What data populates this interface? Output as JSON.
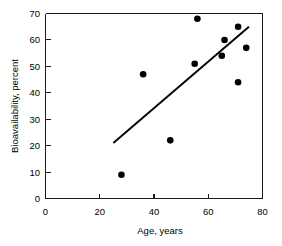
{
  "chart_data": {
    "type": "scatter",
    "title": "",
    "xlabel": "Age, years",
    "ylabel": "Bioavailability, percent",
    "xlim": [
      0,
      80
    ],
    "ylim": [
      0,
      70
    ],
    "xticks": [
      0,
      20,
      40,
      60,
      80
    ],
    "yticks": [
      0,
      10,
      20,
      30,
      40,
      50,
      60,
      70
    ],
    "xtick_labels": [
      "0",
      "20",
      "40",
      "60",
      "80"
    ],
    "ytick_labels": [
      "0",
      "10",
      "20",
      "30",
      "40",
      "50",
      "60",
      "70"
    ],
    "grid": false,
    "legend": null,
    "series": [
      {
        "name": "Bioavailability vs age",
        "marker": "filled-circle",
        "color": "#000000",
        "points": [
          {
            "x": 28,
            "y": 9
          },
          {
            "x": 36,
            "y": 47
          },
          {
            "x": 46,
            "y": 22
          },
          {
            "x": 55,
            "y": 51
          },
          {
            "x": 56,
            "y": 68
          },
          {
            "x": 65,
            "y": 54
          },
          {
            "x": 66,
            "y": 60
          },
          {
            "x": 71,
            "y": 44
          },
          {
            "x": 71,
            "y": 65
          },
          {
            "x": 74,
            "y": 57
          }
        ]
      }
    ],
    "annotations": [
      {
        "kind": "regression-line",
        "color": "#000000",
        "x_start": 25,
        "y_start": 21,
        "x_end": 75,
        "y_end": 65
      }
    ]
  }
}
